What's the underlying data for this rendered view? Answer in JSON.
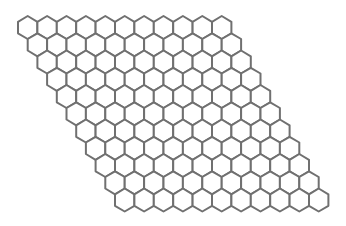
{
  "board": {
    "type": "hex-grid",
    "layout": "rhombus",
    "orientation": "pointy-top",
    "rows": 11,
    "cols": 11,
    "origin": {
      "x": 18,
      "y": 16
    },
    "hex_width": 19.4,
    "hex_vertical_size": 11.5,
    "row_shift": 9.7,
    "stroke_color": "#707070",
    "fill_color": "#ffffff",
    "background": "#ffffff"
  }
}
